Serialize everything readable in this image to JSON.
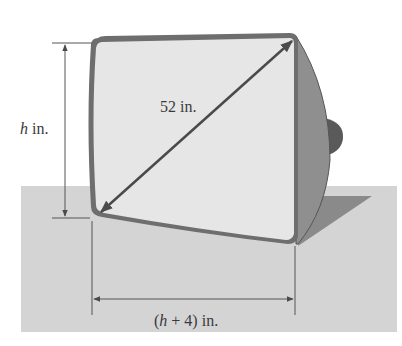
{
  "diagram": {
    "labels": {
      "height_var": "h",
      "height_unit": " in.",
      "diagonal": "52 in.",
      "width_open": "(",
      "width_var": "h",
      "width_rest": " + 4) in."
    },
    "colors": {
      "floor": "#d4d4d4",
      "screen_face": "#e6e6e6",
      "bezel": "#6e6e6e",
      "side_body": "#8f8f8f",
      "knob": "#5a5a5a",
      "shadow": "#8a8a8a",
      "dimension_lines": "#555555"
    }
  }
}
